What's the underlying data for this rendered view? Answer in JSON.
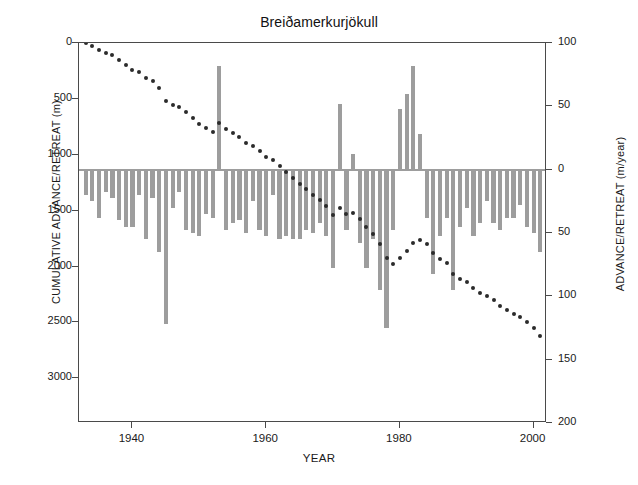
{
  "chart_data": {
    "type": "bar",
    "title": "Breiðamerkurjökull",
    "xlabel": "YEAR",
    "ylabel": "CUMULATIVE ADVANCE/RETREAT (m)",
    "ylabel_right": "ADVANCE/RETREAT (m/year)",
    "xlim": [
      1932,
      2002
    ],
    "xticks": [
      1940,
      1960,
      1980,
      2000
    ],
    "xticklabels": [
      "1940",
      "1960",
      "1980",
      "2000"
    ],
    "ylim_left": [
      3400,
      0
    ],
    "yticks_left": [
      0,
      500,
      1000,
      1500,
      2000,
      2500,
      3000
    ],
    "yticklabels_left": [
      "0",
      "500",
      "1000",
      "1500",
      "2000",
      "2500",
      "3000"
    ],
    "ylim_right": [
      -100,
      200
    ],
    "yticks_right": [
      -100,
      -50,
      0,
      50,
      100,
      150,
      200
    ],
    "yticklabels_right": [
      "100",
      "50",
      "0",
      "50",
      "100",
      "150",
      "200"
    ],
    "grid": false,
    "legend": null,
    "bar_color": "#9d9d9d",
    "line_color": "#2b2b2b",
    "frame_color": "#4a4a4a",
    "note_right_axis": "Right axis is inverted: retreat (positive m/year) plots downward from the 0 baseline; advance plots upward.",
    "series": [
      {
        "name": "ADVANCE/RETREAT (m/year)",
        "type": "bar",
        "axis": "right",
        "x": [
          1933,
          1934,
          1935,
          1936,
          1937,
          1938,
          1939,
          1940,
          1941,
          1942,
          1943,
          1944,
          1945,
          1946,
          1947,
          1948,
          1949,
          1950,
          1951,
          1952,
          1953,
          1954,
          1955,
          1956,
          1957,
          1958,
          1959,
          1960,
          1961,
          1962,
          1963,
          1964,
          1965,
          1966,
          1967,
          1968,
          1969,
          1970,
          1971,
          1972,
          1973,
          1974,
          1975,
          1976,
          1977,
          1978,
          1979,
          1980,
          1981,
          1982,
          1983,
          1984,
          1985,
          1986,
          1987,
          1988,
          1989,
          1990,
          1991,
          1992,
          1993,
          1994,
          1995,
          1996,
          1997,
          1998,
          1999,
          2000,
          2001
        ],
        "values": [
          20,
          25,
          38,
          18,
          22,
          40,
          45,
          45,
          20,
          55,
          22,
          65,
          122,
          30,
          18,
          48,
          50,
          52,
          35,
          38,
          -82,
          48,
          42,
          40,
          50,
          25,
          48,
          52,
          20,
          55,
          52,
          55,
          55,
          48,
          50,
          42,
          52,
          78,
          -52,
          48,
          -12,
          58,
          78,
          55,
          95,
          125,
          48,
          -48,
          -60,
          -82,
          -28,
          38,
          82,
          52,
          38,
          95,
          45,
          30,
          52,
          42,
          25,
          42,
          48,
          38,
          38,
          28,
          45,
          50,
          65
        ]
      },
      {
        "name": "CUMULATIVE ADVANCE/RETREAT (m)",
        "type": "line",
        "axis": "left",
        "marker": "dot",
        "x": [
          1933,
          1934,
          1935,
          1936,
          1937,
          1938,
          1939,
          1940,
          1941,
          1942,
          1943,
          1944,
          1945,
          1946,
          1947,
          1948,
          1949,
          1950,
          1951,
          1952,
          1953,
          1954,
          1955,
          1956,
          1957,
          1958,
          1959,
          1960,
          1961,
          1962,
          1963,
          1964,
          1965,
          1966,
          1967,
          1968,
          1969,
          1970,
          1971,
          1972,
          1973,
          1974,
          1975,
          1976,
          1977,
          1978,
          1979,
          1980,
          1981,
          1982,
          1983,
          1984,
          1985,
          1986,
          1987,
          1988,
          1989,
          1990,
          1991,
          1992,
          1993,
          1994,
          1995,
          1996,
          1997,
          1998,
          1999,
          2000,
          2001
        ],
        "values": [
          0,
          25,
          60,
          85,
          110,
          150,
          195,
          240,
          260,
          315,
          340,
          405,
          520,
          555,
          575,
          620,
          670,
          725,
          760,
          800,
          720,
          765,
          805,
          845,
          895,
          920,
          970,
          1020,
          1045,
          1100,
          1150,
          1205,
          1265,
          1310,
          1360,
          1405,
          1455,
          1535,
          1480,
          1530,
          1520,
          1575,
          1650,
          1705,
          1800,
          1925,
          1975,
          1925,
          1865,
          1785,
          1760,
          1795,
          1880,
          1930,
          1970,
          2065,
          2110,
          2140,
          2195,
          2235,
          2260,
          2300,
          2350,
          2390,
          2425,
          2455,
          2500,
          2550,
          2620
        ]
      }
    ]
  }
}
